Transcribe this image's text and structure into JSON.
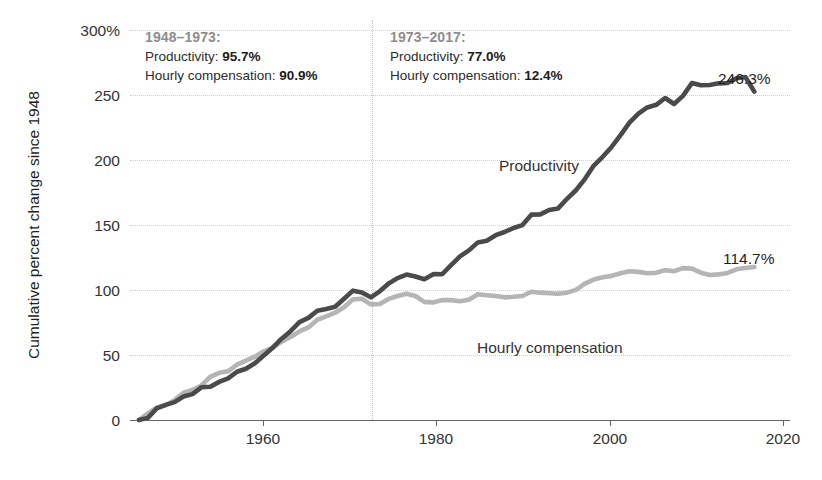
{
  "chart_data": {
    "type": "line",
    "title": "",
    "xlabel": "",
    "ylabel": "Cumulative percent change since 1948",
    "xlim": [
      1947,
      2021
    ],
    "ylim": [
      0,
      300
    ],
    "grid": true,
    "legend_position": "inline-labels",
    "ytick_labels": [
      "300%",
      "250",
      "200",
      "150",
      "100",
      "50",
      "0"
    ],
    "ytick_values": [
      300,
      250,
      200,
      150,
      100,
      50,
      0
    ],
    "xtick_labels": [
      "1960",
      "1980",
      "2000",
      "2020"
    ],
    "xtick_values": [
      1960,
      1980,
      2000,
      2020
    ],
    "annotations": [
      {
        "heading": "1948–1973:",
        "rows": [
          {
            "label": "Productivity:",
            "value": "95.7%"
          },
          {
            "label": "Hourly compensation:",
            "value": "90.9%"
          }
        ]
      },
      {
        "heading": "1973–2017:",
        "rows": [
          {
            "label": "Productivity:",
            "value": "77.0%"
          },
          {
            "label": "Hourly compensation:",
            "value": "12.4%"
          }
        ]
      }
    ],
    "reference_line": {
      "x": 1973,
      "style": "dotted"
    },
    "series": [
      {
        "name": "Productivity",
        "color": "#4a4a4a",
        "end_label": "246.3%",
        "end_value": 246.3,
        "x": [
          1948,
          1949,
          1950,
          1951,
          1952,
          1953,
          1954,
          1955,
          1956,
          1957,
          1958,
          1959,
          1960,
          1961,
          1962,
          1963,
          1964,
          1965,
          1966,
          1967,
          1968,
          1969,
          1970,
          1971,
          1972,
          1973,
          1974,
          1975,
          1976,
          1977,
          1978,
          1979,
          1980,
          1981,
          1982,
          1983,
          1984,
          1985,
          1986,
          1987,
          1988,
          1989,
          1990,
          1991,
          1992,
          1993,
          1994,
          1995,
          1996,
          1997,
          1998,
          1999,
          2000,
          2001,
          2002,
          2003,
          2004,
          2005,
          2006,
          2007,
          2008,
          2009,
          2010,
          2011,
          2012,
          2013,
          2014,
          2015,
          2016,
          2017
        ],
        "values": [
          0,
          1.6,
          8.7,
          11.3,
          13.4,
          17.6,
          19.4,
          24.5,
          25.0,
          28.6,
          31.2,
          36.2,
          38.4,
          42.6,
          48.4,
          54.2,
          61.0,
          66.6,
          73.4,
          76.6,
          82.0,
          83.3,
          85.0,
          90.9,
          97.0,
          95.7,
          92.0,
          96.5,
          102.4,
          106.4,
          109.1,
          107.6,
          105.6,
          109.4,
          109.3,
          116.2,
          122.7,
          127.2,
          133.2,
          134.5,
          138.6,
          141.0,
          144.0,
          146.2,
          154.0,
          154.2,
          157.5,
          158.7,
          165.9,
          172.3,
          180.7,
          190.8,
          197.4,
          204.8,
          213.6,
          223.0,
          229.7,
          234.4,
          236.4,
          241.5,
          237.0,
          243.1,
          252.7,
          251.1,
          251.3,
          252.5,
          252.7,
          256.3,
          257.2,
          246.3
        ]
      },
      {
        "name": "Hourly compensation",
        "color": "#b5b5b5",
        "end_label": "114.7%",
        "end_value": 114.7,
        "x": [
          1948,
          1949,
          1950,
          1951,
          1952,
          1953,
          1954,
          1955,
          1956,
          1957,
          1958,
          1959,
          1960,
          1961,
          1962,
          1963,
          1964,
          1965,
          1966,
          1967,
          1968,
          1969,
          1970,
          1971,
          1972,
          1973,
          1974,
          1975,
          1976,
          1977,
          1978,
          1979,
          1980,
          1981,
          1982,
          1983,
          1984,
          1985,
          1986,
          1987,
          1988,
          1989,
          1990,
          1991,
          1992,
          1993,
          1994,
          1995,
          1996,
          1997,
          1998,
          1999,
          2000,
          2001,
          2002,
          2003,
          2004,
          2005,
          2006,
          2007,
          2008,
          2009,
          2010,
          2011,
          2012,
          2013,
          2014,
          2015,
          2016,
          2017
        ],
        "values": [
          0,
          5.0,
          9.4,
          11.1,
          14.9,
          20.4,
          22.5,
          25.9,
          32.4,
          35.4,
          36.5,
          41.5,
          44.5,
          47.5,
          51.5,
          54.2,
          58.8,
          62.2,
          66.4,
          69.4,
          75.2,
          77.7,
          80.5,
          84.6,
          90.5,
          90.9,
          86.7,
          87.0,
          90.8,
          93.0,
          94.7,
          93.0,
          88.6,
          88.2,
          89.9,
          89.9,
          89.1,
          90.2,
          94.3,
          93.6,
          93.0,
          92.0,
          92.4,
          93.0,
          96.2,
          95.5,
          95.1,
          94.7,
          95.5,
          97.6,
          102.3,
          105.3,
          107.0,
          108.1,
          110.1,
          111.6,
          111.1,
          110.0,
          110.5,
          112.4,
          111.6,
          113.9,
          113.5,
          110.5,
          108.8,
          109.2,
          110.3,
          113.0,
          114.0,
          114.7
        ]
      }
    ]
  }
}
